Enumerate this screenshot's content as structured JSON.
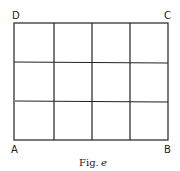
{
  "figure": {
    "caption_prefix": "Fig.",
    "caption_letter": "e",
    "corners": {
      "top_left": "D",
      "top_right": "C",
      "bottom_left": "A",
      "bottom_right": "B"
    },
    "grid": {
      "columns": 4,
      "rows": 3
    },
    "colors": {
      "line": "#222222",
      "background": "#ffffff"
    }
  }
}
